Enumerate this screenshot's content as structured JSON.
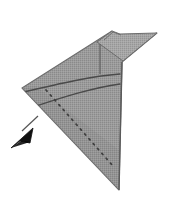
{
  "figure": {
    "title": "Swept delta wing schematic with leader arrow",
    "caption": "",
    "background_color": "#ffffff",
    "canvas": {
      "width": 171,
      "height": 206
    },
    "palette": {
      "body_fill": "#9b9b9b",
      "body_fill_light": "#a8a8a8",
      "body_fill_dark": "#8d8d8d",
      "outline": "#6d6d6d",
      "outline_dark": "#4f4f4f",
      "arc_line": "#4a4a4a",
      "dotted_line": "#4a4a4a",
      "arrow_fill": "#111111",
      "leader_line": "#555555"
    },
    "shapes": [
      {
        "name": "delta-wing-body",
        "kind": "polygon",
        "fill": "#9b9b9b",
        "stroke": "#6d6d6d",
        "points": "22,88 112,31 108,44 157,33 122,62 119,190 "
      },
      {
        "name": "upper-swept-wing",
        "kind": "polygon",
        "fill": "#a2a2a2",
        "stroke": "#6d6d6d",
        "points": "97,42 112,31 120,34 157,33 123,61 "
      },
      {
        "name": "body-shadow-band",
        "kind": "polygon",
        "fill": "#909090",
        "stroke": "none",
        "points": "22,88 119,190 119,150 36,86 "
      }
    ],
    "curves": [
      {
        "name": "leading-edge-arc-upper",
        "kind": "arc",
        "stroke": "#4a4a4a",
        "width": 1.3,
        "path": "M 24,92 C 58,84 92,76 120,74"
      },
      {
        "name": "leading-edge-arc-lower",
        "kind": "arc",
        "stroke": "#4a4a4a",
        "width": 1.3,
        "path": "M 27,109 C 55,100 90,88 120,84"
      },
      {
        "name": "camber-dotted-diagonal",
        "kind": "dotted-line",
        "stroke": "#3f3f3f",
        "width": 1.6,
        "dash": "1.5 5",
        "path": "M 46,90 L 113,166"
      },
      {
        "name": "wing-root-fold-line",
        "kind": "line",
        "stroke": "#5a5a5a",
        "width": 1.1,
        "path": "M 100,44 L 100,74"
      }
    ],
    "annotation": {
      "name": "leader-arrow",
      "label": "",
      "arrow_color": "#111111",
      "leader_path": "M 38,116 L 22,131",
      "arrow_tip": {
        "x": 11,
        "y": 148
      },
      "arrow_polygon": "11,148 33,128 30,143 20,141",
      "direction": "down-left"
    }
  }
}
